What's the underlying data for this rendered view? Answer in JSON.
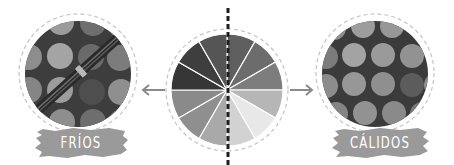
{
  "diagram": {
    "title": "",
    "center": {
      "name": "color-wheel",
      "segments": 12,
      "segment_colors": [
        "#5f5f5f",
        "#6c6c6c",
        "#7d7d7d",
        "#919191",
        "#b6b6b6",
        "#e4e4e4",
        "#cfcfcf",
        "#a9a9a9",
        "#8f8f8f",
        "#8a8a8a",
        "#3a3a3a",
        "#474747"
      ],
      "divider": "vertical-dashed-line"
    },
    "left": {
      "label": "FRÍOS",
      "meaning": "cool colors",
      "arrow_direction": "left",
      "photo": "dotted fabric with zipper"
    },
    "right": {
      "label": "CÁLIDOS",
      "meaning": "warm colors",
      "arrow_direction": "right",
      "photo": "dotted fabric"
    },
    "colors": {
      "background": "#ffffff",
      "banner": "#9a9a9a",
      "banner_text": "#ffffff",
      "dashed_ring": "#c4c4c4",
      "fabric_base": "#3b3b3b",
      "arrow": "#8a8a8a",
      "divider": "#1e1e1e"
    }
  }
}
